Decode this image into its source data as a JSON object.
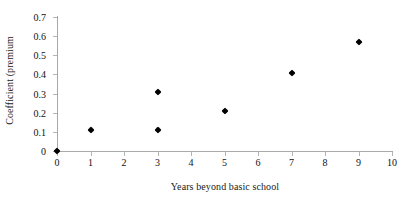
{
  "chart_data": {
    "type": "scatter",
    "title": "",
    "xlabel": "Years beyond basic school",
    "ylabel": "Coefficient (premium",
    "xlim": [
      0,
      10
    ],
    "ylim": [
      0,
      0.7
    ],
    "xticks": [
      "0",
      "1",
      "2",
      "3",
      "4",
      "5",
      "6",
      "7",
      "8",
      "9",
      "10"
    ],
    "yticks": [
      "0",
      "0.1",
      "0.2",
      "0.3",
      "0.4",
      "0.5",
      "0.6",
      "0.7"
    ],
    "grid": false,
    "legend": null,
    "marker_color": "#000000",
    "axis_color": "#a9a9a9",
    "series": [
      {
        "name": "Coefficient (premium",
        "points": [
          {
            "x": 0,
            "y": 0.0
          },
          {
            "x": 1,
            "y": 0.11
          },
          {
            "x": 3,
            "y": 0.11
          },
          {
            "x": 3,
            "y": 0.31
          },
          {
            "x": 5,
            "y": 0.21
          },
          {
            "x": 7,
            "y": 0.41
          },
          {
            "x": 9,
            "y": 0.57
          }
        ]
      }
    ]
  }
}
